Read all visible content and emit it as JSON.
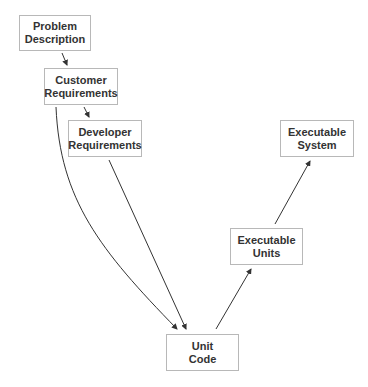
{
  "diagram": {
    "nodes": [
      {
        "id": "problem-description",
        "line1": "Problem",
        "line2": "Description",
        "x": 19,
        "y": 15,
        "w": 72,
        "h": 36
      },
      {
        "id": "customer-requirements",
        "line1": "Customer",
        "line2": "Requirements",
        "x": 44,
        "y": 68,
        "w": 74,
        "h": 37
      },
      {
        "id": "developer-requirements",
        "line1": "Developer",
        "line2": "Requirements",
        "x": 68,
        "y": 120,
        "w": 74,
        "h": 37
      },
      {
        "id": "executable-system",
        "line1": "Executable",
        "line2": "System",
        "x": 280,
        "y": 120,
        "w": 74,
        "h": 37
      },
      {
        "id": "executable-units",
        "line1": "Executable",
        "line2": "Units",
        "x": 230,
        "y": 228,
        "w": 73,
        "h": 37
      },
      {
        "id": "unit-code",
        "line1": "Unit",
        "line2": "Code",
        "x": 166,
        "y": 334,
        "w": 73,
        "h": 37
      }
    ],
    "edges": [
      {
        "from": "problem-description",
        "to": "customer-requirements"
      },
      {
        "from": "customer-requirements",
        "to": "developer-requirements"
      },
      {
        "from": "customer-requirements",
        "to": "unit-code",
        "curved": true
      },
      {
        "from": "developer-requirements",
        "to": "unit-code"
      },
      {
        "from": "unit-code",
        "to": "executable-units"
      },
      {
        "from": "executable-units",
        "to": "executable-system"
      }
    ],
    "colors": {
      "line": "#333333",
      "border": "#b8b8b8",
      "text": "#333333"
    }
  }
}
